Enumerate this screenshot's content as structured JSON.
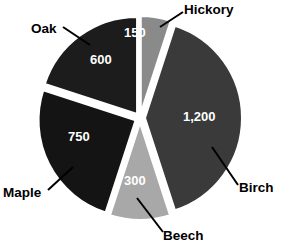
{
  "chart_data": {
    "type": "pie",
    "title": "",
    "subtitle": "",
    "xlabel": "",
    "ylabel": "",
    "legend_position": "none",
    "grid": false,
    "exploded": true,
    "total": 3000,
    "categories": [
      "Hickory",
      "Birch",
      "Beech",
      "Maple",
      "Oak"
    ],
    "values": [
      150,
      1200,
      300,
      750,
      600
    ],
    "value_labels": [
      "150",
      "1,200",
      "300",
      "750",
      "600"
    ],
    "slices": [
      {
        "name": "Hickory",
        "value": 150,
        "value_label": "150",
        "percent": 5,
        "color": "#8a8a8a",
        "start_angle": 0,
        "sweep_angle": 18
      },
      {
        "name": "Birch",
        "value": 1200,
        "value_label": "1,200",
        "percent": 40,
        "color": "#3a3a3a",
        "start_angle": 18,
        "sweep_angle": 144
      },
      {
        "name": "Beech",
        "value": 300,
        "value_label": "300",
        "percent": 10,
        "color": "#a8a8a8",
        "start_angle": 162,
        "sweep_angle": 36
      },
      {
        "name": "Maple",
        "value": 750,
        "value_label": "750",
        "percent": 25,
        "color": "#141414",
        "start_angle": 198,
        "sweep_angle": 90
      },
      {
        "name": "Oak",
        "value": 600,
        "value_label": "600",
        "percent": 20,
        "color": "#1c1c1c",
        "start_angle": 288,
        "sweep_angle": 72
      }
    ],
    "colors": {
      "background": "#ffffff",
      "label_text": "#000000",
      "value_text": "#ffffff",
      "leader_line": "#000000"
    }
  }
}
